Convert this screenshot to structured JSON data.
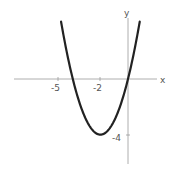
{
  "chart_data": {
    "type": "line",
    "title": "",
    "xlabel": "x",
    "ylabel": "y",
    "function": "y = x^2 + 4x",
    "vertex": [
      -2,
      -4
    ],
    "roots": [
      -4,
      0
    ],
    "x_ticks": [
      {
        "value": -5,
        "label": "-5"
      },
      {
        "value": -2,
        "label": "-2"
      }
    ],
    "y_ticks": [
      {
        "value": -4,
        "label": "-4"
      }
    ],
    "xlim": [
      -8.5,
      2.1
    ],
    "ylim": [
      -6.0,
      4.5
    ],
    "grid": false,
    "series": [
      {
        "name": "parabola",
        "x": [
          -4.85,
          -4.5,
          -4,
          -3.5,
          -3,
          -2.5,
          -2,
          -1.5,
          -1,
          -0.5,
          0,
          0.5,
          0.85
        ],
        "values": [
          4.12,
          2.25,
          0,
          -1.75,
          -3,
          -3.75,
          -4,
          -3.75,
          -3,
          -1.75,
          0,
          2.25,
          4.12
        ]
      }
    ]
  },
  "labels": {
    "x_axis": "x",
    "y_axis": "y",
    "tick_x1": "-5",
    "tick_x2": "-2",
    "tick_y1": "-4"
  }
}
